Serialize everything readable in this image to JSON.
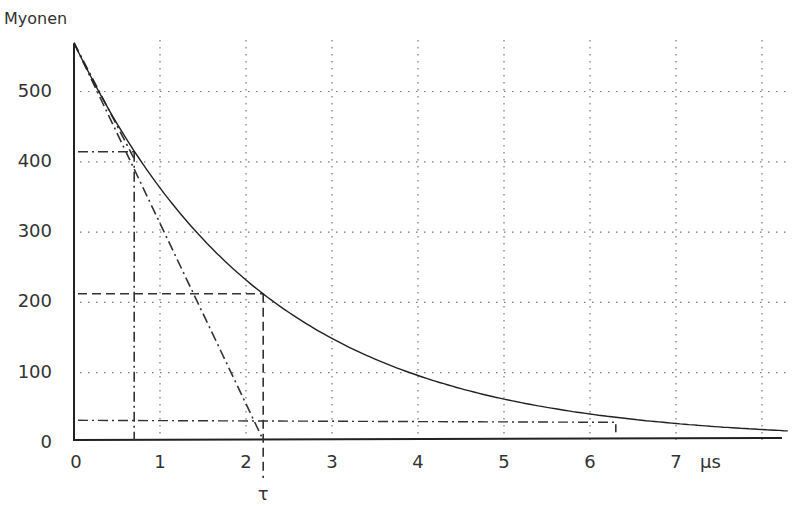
{
  "chart_data": {
    "type": "line",
    "title": "",
    "ylabel": "Myonen",
    "xlabel": "µs",
    "xlim": [
      0,
      8.3
    ],
    "ylim": [
      0,
      570
    ],
    "x_ticks": [
      "0",
      "1",
      "2",
      "3",
      "4",
      "5",
      "6",
      "7"
    ],
    "x_unit_label": "µs",
    "y_ticks": [
      "0",
      "100",
      "200",
      "300",
      "400",
      "500"
    ],
    "grid": true,
    "tau_label": "τ",
    "series": [
      {
        "name": "Zerfallskurve",
        "style": "solid",
        "N0": 565,
        "tau": 2.2
      },
      {
        "name": "Tangente bei t=0",
        "style": "dash-dot",
        "x": [
          0,
          2.2
        ],
        "y": [
          565,
          0
        ]
      },
      {
        "name": "Sekante",
        "style": "dash-dot",
        "x": [
          0,
          0.7
        ],
        "y": [
          565,
          410
        ]
      }
    ],
    "annotations": [
      {
        "type": "dashed-crosshair",
        "x": 2.2,
        "y": 208,
        "label": "τ"
      },
      {
        "type": "dash-dot-crosshair",
        "x": 0.7,
        "y": 410
      },
      {
        "type": "dash-dot-horizontal",
        "y": 28,
        "x_end": 6.3
      }
    ]
  }
}
